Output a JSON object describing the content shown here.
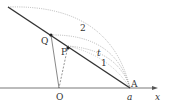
{
  "figure": {
    "points": {
      "O": {
        "label": "O",
        "x": 59,
        "y": 88
      },
      "A": {
        "label": "A",
        "x": 130,
        "y": 88
      },
      "Q": {
        "label": "Q",
        "x": 51,
        "y": 35
      },
      "P": {
        "label": "P",
        "x": 68,
        "y": 46
      },
      "line_start": {
        "x": 8,
        "y": 7
      }
    },
    "axis": {
      "label": "x",
      "tick_label": "a"
    },
    "arc_labels": {
      "outer": "2",
      "middle": "t",
      "inner": "1"
    },
    "colors": {
      "line": "#333333",
      "axis": "#555555",
      "dotted": "#888888"
    }
  }
}
